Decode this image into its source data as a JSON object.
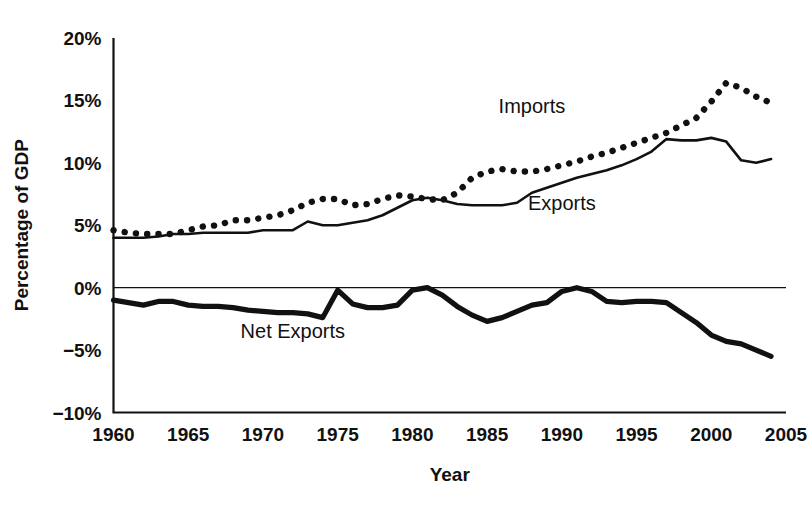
{
  "chart_data": {
    "type": "line",
    "title": "",
    "xlabel": "Year",
    "ylabel": "Percentage of GDP",
    "xlim": [
      1960,
      2005
    ],
    "ylim": [
      -10,
      20
    ],
    "grid": false,
    "legend_position": "inline-annotations",
    "y_ticks": [
      "20%",
      "15%",
      "10%",
      "5%",
      "0%",
      "-5%",
      "-10%"
    ],
    "y_tick_values": [
      20,
      15,
      10,
      5,
      0,
      -5,
      -10
    ],
    "x_ticks": [
      "1960",
      "1965",
      "1970",
      "1975",
      "1980",
      "1985",
      "1990",
      "1995",
      "2000",
      "2005"
    ],
    "x_tick_values": [
      1960,
      1965,
      1970,
      1975,
      1980,
      1985,
      1990,
      1995,
      2000,
      2005
    ],
    "x": [
      1960,
      1961,
      1962,
      1963,
      1964,
      1965,
      1966,
      1967,
      1968,
      1969,
      1970,
      1971,
      1972,
      1973,
      1974,
      1975,
      1976,
      1977,
      1978,
      1979,
      1980,
      1981,
      1982,
      1983,
      1984,
      1985,
      1986,
      1987,
      1988,
      1989,
      1990,
      1991,
      1992,
      1993,
      1994,
      1995,
      1996,
      1997,
      1998,
      1999,
      2000,
      2001,
      2002,
      2003,
      2004
    ],
    "series": [
      {
        "name": "Imports",
        "style": "dotted",
        "values": [
          4.6,
          4.4,
          4.3,
          4.3,
          4.3,
          4.6,
          4.9,
          5.0,
          5.4,
          5.4,
          5.6,
          5.8,
          6.2,
          6.8,
          7.1,
          7.1,
          6.6,
          6.7,
          7.1,
          7.4,
          7.3,
          7.1,
          7.0,
          7.6,
          8.8,
          9.3,
          9.5,
          9.3,
          9.3,
          9.5,
          9.8,
          10.1,
          10.5,
          10.8,
          11.2,
          11.6,
          12.0,
          12.4,
          13.0,
          13.6,
          14.9,
          16.4,
          16.0,
          15.3,
          14.8
        ],
        "label_x": 1988,
        "label_y": 14.0,
        "unit": "% of GDP"
      },
      {
        "name": "Exports",
        "style": "solid",
        "values": [
          4.0,
          4.0,
          4.0,
          4.1,
          4.3,
          4.3,
          4.4,
          4.4,
          4.4,
          4.4,
          4.6,
          4.6,
          4.6,
          5.3,
          5.0,
          5.0,
          5.2,
          5.4,
          5.8,
          6.4,
          7.0,
          7.2,
          7.0,
          6.7,
          6.6,
          6.6,
          6.6,
          6.8,
          7.6,
          8.0,
          8.4,
          8.8,
          9.1,
          9.4,
          9.8,
          10.3,
          10.9,
          11.9,
          11.8,
          11.8,
          12.0,
          11.7,
          10.2,
          10.0,
          10.3
        ],
        "label_x": 1990,
        "label_y": 6.2,
        "unit": "% of GDP"
      },
      {
        "name": "Net Exports",
        "style": "thick",
        "values": [
          -1.0,
          -1.2,
          -1.4,
          -1.1,
          -1.1,
          -1.4,
          -1.5,
          -1.5,
          -1.6,
          -1.8,
          -1.9,
          -2.0,
          -2.0,
          -2.1,
          -2.4,
          -0.2,
          -1.3,
          -1.6,
          -1.6,
          -1.4,
          -0.2,
          0.0,
          -0.6,
          -1.5,
          -2.2,
          -2.7,
          -2.4,
          -1.9,
          -1.4,
          -1.2,
          -0.3,
          0.0,
          -0.3,
          -1.1,
          -1.2,
          -1.1,
          -1.1,
          -1.2,
          -2.0,
          -2.8,
          -3.8,
          -4.3,
          -4.5,
          -5.0,
          -5.5
        ],
        "label_x": 1972,
        "label_y": -4.0,
        "unit": "% of GDP"
      }
    ]
  },
  "labels": {
    "imports": "Imports",
    "exports": "Exports",
    "net_exports": "Net Exports",
    "x_axis_title": "Year",
    "y_axis_title": "Percentage of GDP"
  }
}
